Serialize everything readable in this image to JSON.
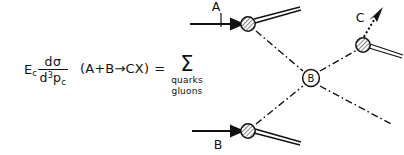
{
  "figure": {
    "kind": "parton-model-hard-scattering-diagram",
    "background_color": "#ffffff",
    "ink_color": "#111111"
  },
  "formula": {
    "energy_symbol": "E",
    "energy_subscript": "c",
    "numerator_d": "d",
    "numerator_sigma": "σ",
    "denominator_d": "d",
    "denominator_exponent": "3",
    "denominator_p": "p",
    "denominator_subscript": "c",
    "reaction": "(A+B→CX)",
    "equals": "=",
    "sigma_symbol": "Σ",
    "sum_labels": [
      "quarks",
      "gluons"
    ]
  },
  "diagram": {
    "labels": {
      "a": "A",
      "b": "B",
      "blob": "B",
      "c": "C"
    },
    "vertices": [
      {
        "name": "vertex-a",
        "x": 248,
        "y": 24,
        "style": "hatched-circle"
      },
      {
        "name": "vertex-b",
        "x": 248,
        "y": 131,
        "style": "hatched-circle"
      },
      {
        "name": "vertex-c",
        "x": 363,
        "y": 45,
        "style": "hatched-circle"
      },
      {
        "name": "vertex-hard-scatter",
        "x": 311,
        "y": 78,
        "style": "open-circle-labeled"
      }
    ],
    "lines": [
      {
        "name": "incoming-a",
        "style": "solid-arrow"
      },
      {
        "name": "incoming-b",
        "style": "solid-arrow"
      },
      {
        "name": "remnant-a",
        "style": "double-line"
      },
      {
        "name": "remnant-b",
        "style": "double-line"
      },
      {
        "name": "remnant-c",
        "style": "double-line"
      },
      {
        "name": "parton-a-to-blob",
        "style": "dash-dot"
      },
      {
        "name": "parton-b-to-blob",
        "style": "dash-dot"
      },
      {
        "name": "parton-blob-to-c",
        "style": "dash-dot"
      },
      {
        "name": "parton-blob-outgoing",
        "style": "dash-dot"
      },
      {
        "name": "detected-particle-c",
        "style": "dotted-arrow"
      }
    ]
  }
}
